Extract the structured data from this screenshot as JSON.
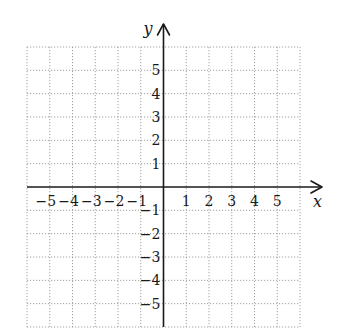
{
  "chart_data": {
    "type": "scatter",
    "title": "",
    "xlabel": "x",
    "ylabel": "y",
    "xlim": [
      -6,
      6
    ],
    "ylim": [
      -6,
      6
    ],
    "grid": true,
    "grid_style": "dotted",
    "x_ticks": [
      -5,
      -4,
      -3,
      -2,
      -1,
      1,
      2,
      3,
      4,
      5
    ],
    "y_ticks": [
      5,
      4,
      3,
      2,
      1,
      -1,
      -2,
      -3,
      -4,
      -5
    ],
    "x_tick_labels": [
      "−5",
      "−4",
      "−3",
      "−2",
      "−1",
      "1",
      "2",
      "3",
      "4",
      "5"
    ],
    "y_tick_labels": [
      "5",
      "4",
      "3",
      "2",
      "1",
      "−1",
      "−2",
      "−3",
      "−4",
      "−5"
    ],
    "series": [],
    "legend": null
  },
  "layout": {
    "grid_left": 27,
    "grid_right": 300,
    "grid_top": 47,
    "grid_bottom": 327,
    "origin_x": 163.5,
    "origin_y": 187,
    "x_axis_end": 322,
    "y_axis_top": 24,
    "colors": {
      "axis": "#1a1a1a",
      "grid": "#8a8a8a",
      "background": "#ffffff"
    }
  }
}
